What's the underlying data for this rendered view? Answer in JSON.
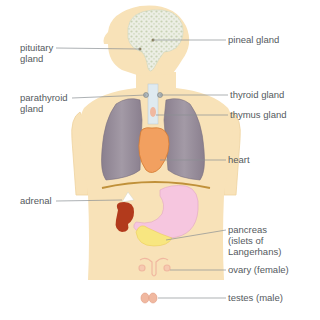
{
  "diagram": {
    "colors": {
      "skin": "#f8e2b8",
      "skin_edge": "#efd3a0",
      "brain": "#e8e8e0",
      "brain_dots": "#c5cfb0",
      "lung": "#8d8290",
      "lung_light": "#a79fab",
      "heart": "#f2a060",
      "diaphragm": "#c0913a",
      "stomach": "#f6c6df",
      "kidney": "#b23a1c",
      "pancreas": "#f8e680",
      "ovary": "#f0b8a0",
      "leader_line": "#8a8f93",
      "label_text": "#555a5e"
    },
    "labels": [
      {
        "id": "pituitary",
        "text": "pituitary\ngland",
        "side": "left"
      },
      {
        "id": "parathyroid",
        "text": "parathyroid\ngland",
        "side": "left"
      },
      {
        "id": "adrenal",
        "text": "adrenal",
        "side": "left"
      },
      {
        "id": "pineal",
        "text": "pineal gland",
        "side": "right"
      },
      {
        "id": "thyroid",
        "text": "thyroid gland",
        "side": "right"
      },
      {
        "id": "thymus",
        "text": "thymus gland",
        "side": "right"
      },
      {
        "id": "heart",
        "text": "heart",
        "side": "right"
      },
      {
        "id": "pancreas",
        "text": "pancreas\n(islets of\nLangerhans)",
        "side": "right"
      },
      {
        "id": "ovary",
        "text": "ovary (female)",
        "side": "right"
      },
      {
        "id": "testes",
        "text": "testes (male)",
        "side": "right"
      }
    ]
  }
}
